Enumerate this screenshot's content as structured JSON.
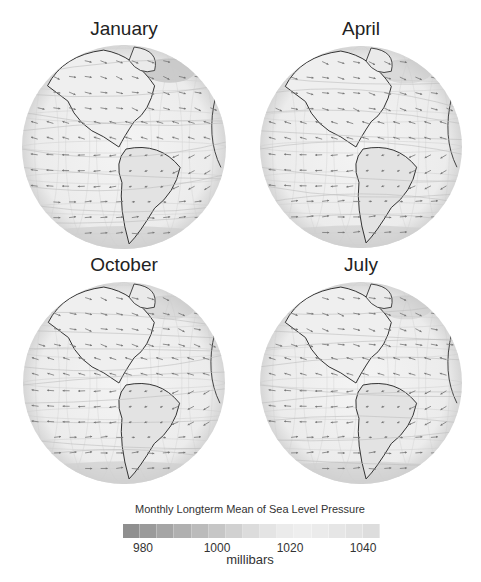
{
  "panels": [
    {
      "title": "January",
      "cx": 124,
      "cy": 147,
      "r": 102,
      "title_top": 18
    },
    {
      "title": "April",
      "cx": 361,
      "cy": 147,
      "r": 101,
      "title_top": 18
    },
    {
      "title": "October",
      "cx": 124,
      "cy": 383,
      "r": 101,
      "title_top": 254
    },
    {
      "title": "July",
      "cx": 361,
      "cy": 383,
      "r": 101,
      "title_top": 254
    }
  ],
  "colorbar": {
    "title": "Monthly Longterm Mean of Sea Level Pressure",
    "units": "millibars",
    "ticks": [
      {
        "label": "980",
        "x": 143
      },
      {
        "label": "1000",
        "x": 217
      },
      {
        "label": "1020",
        "x": 290
      },
      {
        "label": "1040",
        "x": 363
      }
    ],
    "colors": [
      "#8f8f8f",
      "#9a9a9a",
      "#a5a5a5",
      "#b0b0b0",
      "#bbbbbb",
      "#c6c6c6",
      "#d1d1d1",
      "#dcdcdc",
      "#e4e4e4",
      "#ebebeb",
      "#eeeeee",
      "#ebebeb",
      "#e6e6e6",
      "#e2e2e2",
      "#dddddd"
    ]
  },
  "colors": {
    "ocean": "#f1f1f1",
    "land_line": "#333333",
    "arrow": "#777777",
    "grid": "#cfcfcf"
  }
}
